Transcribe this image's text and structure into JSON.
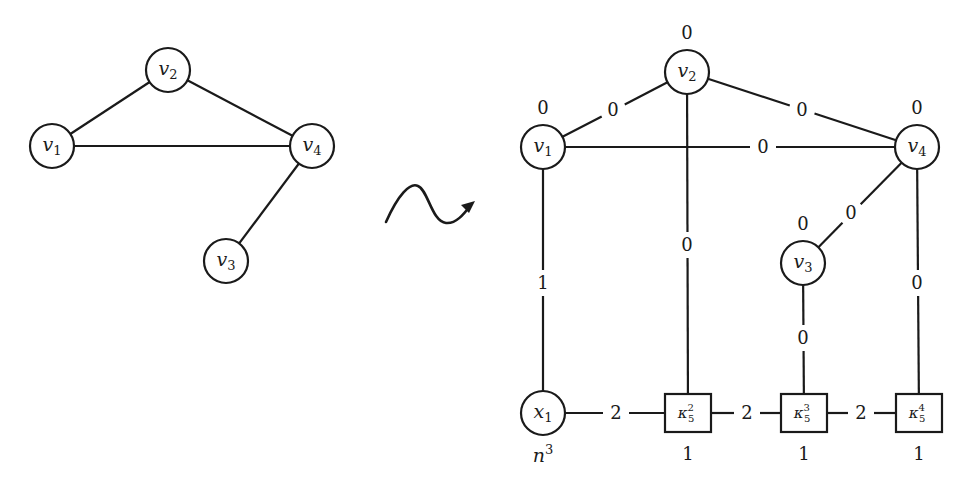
{
  "left_graph": {
    "nodes": [
      {
        "id": "v1",
        "base": "v",
        "sub": "1"
      },
      {
        "id": "v2",
        "base": "v",
        "sub": "2"
      },
      {
        "id": "v3",
        "base": "v",
        "sub": "3"
      },
      {
        "id": "v4",
        "base": "v",
        "sub": "4"
      }
    ],
    "edges": [
      {
        "from": "v1",
        "to": "v2"
      },
      {
        "from": "v1",
        "to": "v4"
      },
      {
        "from": "v2",
        "to": "v4"
      },
      {
        "from": "v4",
        "to": "v3"
      }
    ]
  },
  "transform_arrow": {
    "icon": "squiggle-arrow-icon"
  },
  "right_graph": {
    "vertex_nodes": [
      {
        "id": "v1",
        "base": "v",
        "sub": "1",
        "weight": "0"
      },
      {
        "id": "v2",
        "base": "v",
        "sub": "2",
        "weight": "0"
      },
      {
        "id": "v3",
        "base": "v",
        "sub": "3",
        "weight": "0"
      },
      {
        "id": "v4",
        "base": "v",
        "sub": "4",
        "weight": "0"
      }
    ],
    "x_node": {
      "id": "x1",
      "base": "x",
      "sub": "1",
      "weight": "n",
      "weight_sup": "3"
    },
    "box_nodes": [
      {
        "id": "k2",
        "base": "κ",
        "sub": "5",
        "sup": "2",
        "weight": "1"
      },
      {
        "id": "k3",
        "base": "κ",
        "sub": "5",
        "sup": "3",
        "weight": "1"
      },
      {
        "id": "k4",
        "base": "κ",
        "sub": "5",
        "sup": "4",
        "weight": "1"
      }
    ],
    "edges": [
      {
        "from": "v1",
        "to": "v2",
        "label": "0"
      },
      {
        "from": "v1",
        "to": "v4",
        "label": "0"
      },
      {
        "from": "v2",
        "to": "v4",
        "label": "0"
      },
      {
        "from": "v4",
        "to": "v3",
        "label": "0"
      },
      {
        "from": "v1",
        "to": "x1",
        "label": "1"
      },
      {
        "from": "v2",
        "to": "k2",
        "label": "0"
      },
      {
        "from": "v3",
        "to": "k3",
        "label": "0"
      },
      {
        "from": "v4",
        "to": "k4",
        "label": "0"
      },
      {
        "from": "x1",
        "to": "k2",
        "label": "2"
      },
      {
        "from": "k2",
        "to": "k3",
        "label": "2"
      },
      {
        "from": "k3",
        "to": "k4",
        "label": "2"
      }
    ]
  }
}
